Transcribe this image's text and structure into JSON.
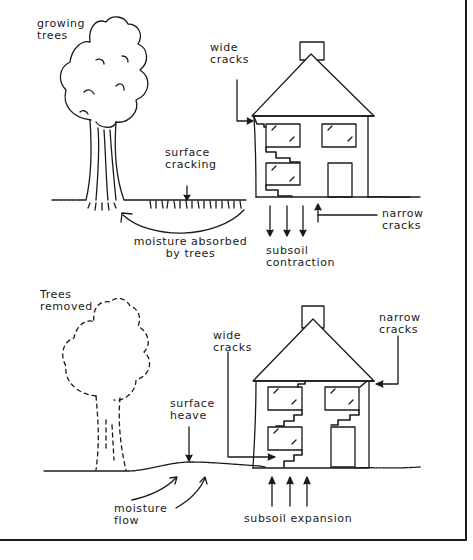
{
  "top_panel": {
    "tree_label": [
      "growing",
      "trees"
    ],
    "wide_cracks_label": [
      "wide",
      "cracks"
    ],
    "surface_label": [
      "surface",
      "cracking"
    ],
    "moisture_label": [
      "moisture absorbed",
      "by trees"
    ],
    "subsoil_label": [
      "subsoil",
      "contraction"
    ],
    "narrow_cracks_label": [
      "narrow",
      "cracks"
    ]
  },
  "bottom_panel": {
    "tree_label": [
      "Trees",
      "removed"
    ],
    "wide_cracks_label": [
      "wide",
      "cracks"
    ],
    "narrow_cracks_label": [
      "narrow",
      "cracks"
    ],
    "surface_label": [
      "surface",
      "heave"
    ],
    "moisture_label": [
      "moisture",
      "flow"
    ],
    "subsoil_label": [
      "subsoil expansion"
    ]
  },
  "colors": {
    "ink": "#1a1a1a",
    "background": "#ffffff"
  }
}
